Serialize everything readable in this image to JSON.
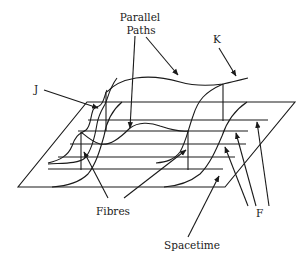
{
  "diagram": {
    "type": "fibre-bundle-illustration",
    "labels": {
      "parallel_paths_line1": "Parallel",
      "parallel_paths_line2": "Paths",
      "k": "K",
      "j": "J",
      "fibres": "Fibres",
      "f": "F",
      "spacetime": "Spacetime"
    },
    "colors": {
      "ink": "#1a1a1a",
      "background": "#ffffff"
    }
  }
}
